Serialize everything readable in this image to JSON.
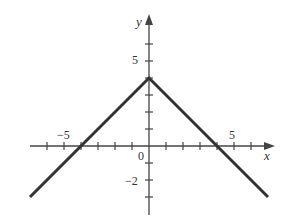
{
  "chart_data": {
    "type": "line",
    "title": "",
    "function": "y = 4 - |x|",
    "xlabel": "x",
    "ylabel": "y",
    "xlim": [
      -7,
      7
    ],
    "ylim": [
      -3,
      7
    ],
    "grid": false,
    "x_tick_step": 1,
    "y_tick_step": 1,
    "x_tick_labels": [
      {
        "value": -5,
        "label": "−5"
      },
      {
        "value": 5,
        "label": "5"
      }
    ],
    "y_tick_labels": [
      {
        "value": 5,
        "label": "5"
      },
      {
        "value": -2,
        "label": "−2"
      }
    ],
    "origin_label": "0",
    "series": [
      {
        "name": "y = 4 - |x|",
        "points": [
          [
            -7,
            -3
          ],
          [
            0,
            4
          ],
          [
            7,
            -3
          ]
        ]
      }
    ],
    "line_color": "#333333"
  },
  "labels": {
    "x_axis": "x",
    "y_axis": "y",
    "origin": "0",
    "x_neg5": "−5",
    "x_pos5": "5",
    "y_pos5": "5",
    "y_neg2": "−2"
  }
}
